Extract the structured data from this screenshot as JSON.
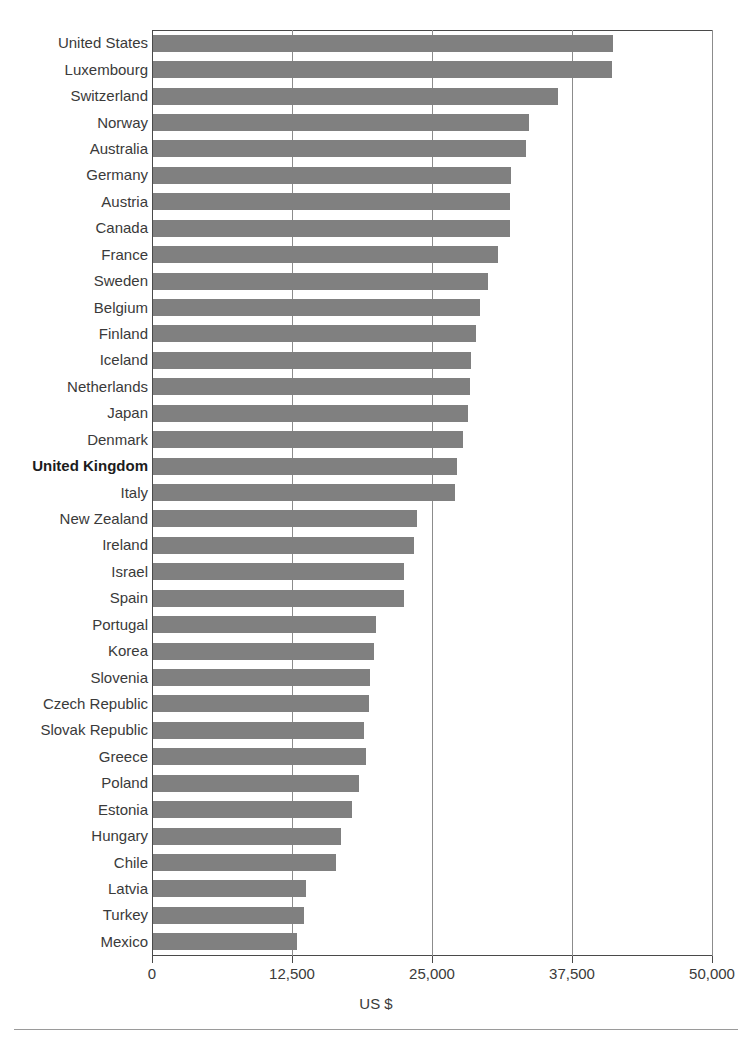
{
  "chart_data": {
    "type": "bar",
    "orientation": "horizontal",
    "title": "",
    "subtitle": "",
    "xlabel": "US $",
    "ylabel": "",
    "xlim": [
      0,
      50000
    ],
    "xticks": [
      0,
      12500,
      25000,
      37500,
      50000
    ],
    "xtick_labels": [
      "0",
      "12,500",
      "25,000",
      "37,500",
      "50,000"
    ],
    "grid": "vertical",
    "legend": "none",
    "bar_color": "#808080",
    "highlight_category": "United Kingdom",
    "categories": [
      "United States",
      "Luxembourg",
      "Switzerland",
      "Norway",
      "Australia",
      "Germany",
      "Austria",
      "Canada",
      "France",
      "Sweden",
      "Belgium",
      "Finland",
      "Iceland",
      "Netherlands",
      "Japan",
      "Denmark",
      "United Kingdom",
      "Italy",
      "New Zealand",
      "Ireland",
      "Israel",
      "Spain",
      "Portugal",
      "Korea",
      "Slovenia",
      "Czech Republic",
      "Slovak Republic",
      "Greece",
      "Poland",
      "Estonia",
      "Hungary",
      "Chile",
      "Latvia",
      "Turkey",
      "Mexico"
    ],
    "values": [
      41100,
      41000,
      36200,
      33600,
      33300,
      32000,
      31900,
      31900,
      30800,
      29900,
      29200,
      28800,
      28400,
      28300,
      28100,
      27700,
      27100,
      27000,
      23600,
      23300,
      22400,
      22400,
      19900,
      19700,
      19400,
      19300,
      18800,
      19000,
      18400,
      17800,
      16800,
      16300,
      13700,
      13500,
      12900
    ],
    "unit": "US $"
  },
  "footer": {
    "rule": true
  }
}
